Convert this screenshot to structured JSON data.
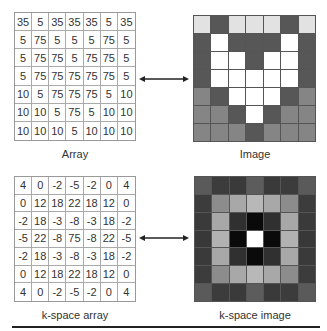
{
  "panels": {
    "array": {
      "caption": "Array",
      "values": [
        [
          "35",
          "5",
          "35",
          "35",
          "35",
          "5",
          "35"
        ],
        [
          "5",
          "75",
          "5",
          "5",
          "5",
          "75",
          "5"
        ],
        [
          "5",
          "75",
          "75",
          "5",
          "75",
          "75",
          "5"
        ],
        [
          "5",
          "75",
          "75",
          "75",
          "75",
          "75",
          "5"
        ],
        [
          "10",
          "5",
          "75",
          "75",
          "75",
          "5",
          "10"
        ],
        [
          "10",
          "10",
          "5",
          "75",
          "5",
          "10",
          "10"
        ],
        [
          "10",
          "10",
          "10",
          "5",
          "10",
          "10",
          "10"
        ]
      ]
    },
    "image": {
      "caption": "Image",
      "pixels": [
        [
          "#e2e2e2",
          "#575757",
          "#e2e2e2",
          "#e2e2e2",
          "#e2e2e2",
          "#575757",
          "#e2e2e2"
        ],
        [
          "#575757",
          "#ffffff",
          "#575757",
          "#575757",
          "#575757",
          "#ffffff",
          "#575757"
        ],
        [
          "#575757",
          "#ffffff",
          "#ffffff",
          "#575757",
          "#ffffff",
          "#ffffff",
          "#575757"
        ],
        [
          "#575757",
          "#ffffff",
          "#ffffff",
          "#ffffff",
          "#ffffff",
          "#ffffff",
          "#575757"
        ],
        [
          "#858585",
          "#575757",
          "#ffffff",
          "#ffffff",
          "#ffffff",
          "#575757",
          "#858585"
        ],
        [
          "#858585",
          "#858585",
          "#575757",
          "#ffffff",
          "#575757",
          "#858585",
          "#858585"
        ],
        [
          "#858585",
          "#858585",
          "#858585",
          "#575757",
          "#858585",
          "#858585",
          "#858585"
        ]
      ]
    },
    "kspace_array": {
      "caption": "k-space array",
      "values": [
        [
          "4",
          "0",
          "-2",
          "-5",
          "-2",
          "0",
          "4"
        ],
        [
          "0",
          "12",
          "18",
          "22",
          "18",
          "12",
          "0"
        ],
        [
          "-2",
          "18",
          "-3",
          "-8",
          "-3",
          "18",
          "-2"
        ],
        [
          "-5",
          "22",
          "-8",
          "75",
          "-8",
          "22",
          "-5"
        ],
        [
          "-2",
          "18",
          "-3",
          "-8",
          "-3",
          "18",
          "-2"
        ],
        [
          "0",
          "12",
          "18",
          "22",
          "18",
          "12",
          "0"
        ],
        [
          "4",
          "0",
          "-2",
          "-5",
          "-2",
          "0",
          "4"
        ]
      ]
    },
    "kspace_image": {
      "caption": "k-space image",
      "pixels": [
        [
          "#5a5a5a",
          "#3c3c3c",
          "#3a3a3a",
          "#5c5c5c",
          "#3a3a3a",
          "#3c3c3c",
          "#5a5a5a"
        ],
        [
          "#3c3c3c",
          "#8c8c8c",
          "#a8a8a8",
          "#b8b8b8",
          "#a8a8a8",
          "#8c8c8c",
          "#3c3c3c"
        ],
        [
          "#3a3a3a",
          "#a8a8a8",
          "#303030",
          "#0a0a0a",
          "#303030",
          "#a8a8a8",
          "#3a3a3a"
        ],
        [
          "#383838",
          "#b2b2b2",
          "#0a0a0a",
          "#ffffff",
          "#0a0a0a",
          "#b2b2b2",
          "#383838"
        ],
        [
          "#3a3a3a",
          "#a8a8a8",
          "#303030",
          "#0a0a0a",
          "#303030",
          "#a8a8a8",
          "#3a3a3a"
        ],
        [
          "#3c3c3c",
          "#8c8c8c",
          "#a8a8a8",
          "#b8b8b8",
          "#a8a8a8",
          "#8c8c8c",
          "#3c3c3c"
        ],
        [
          "#5a5a5a",
          "#3c3c3c",
          "#3a3a3a",
          "#5c5c5c",
          "#3a3a3a",
          "#3c3c3c",
          "#5a5a5a"
        ]
      ]
    }
  },
  "arrows": [
    {
      "label": "array-to-image",
      "direction": "bidirectional"
    },
    {
      "label": "kspace-array-to-kspace-image",
      "direction": "bidirectional"
    }
  ]
}
